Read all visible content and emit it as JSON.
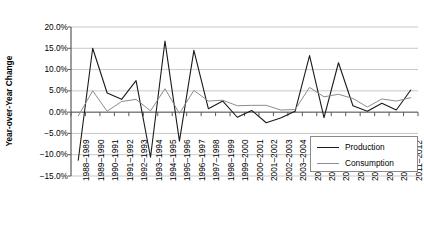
{
  "chart_data": {
    "type": "line",
    "title": "",
    "subtitle": "",
    "xlabel": "",
    "ylabel": "Year-over-Year Change",
    "ylim": [
      -15,
      20
    ],
    "ytick_values": [
      20,
      15,
      10,
      5,
      0,
      -5,
      -10,
      -15
    ],
    "ytick_labels": [
      "20.0%",
      "15.0%",
      "10.0%",
      "5.0%",
      "0.0%",
      "−5.0%",
      "−10.0%",
      "−15.0%"
    ],
    "grid": true,
    "grid_axis": "y",
    "legend_position": "bottom-right",
    "categories": [
      "1988–1989",
      "1989–1990",
      "1990–1991",
      "1991–1992",
      "1992–1993",
      "1993–1994",
      "1994–1995",
      "1995–1996",
      "1996–1997",
      "1997–1998",
      "1998–1999",
      "1999–2000",
      "2000–2001",
      "2001–2002",
      "2002–2003",
      "2003–2004",
      "2004–2005",
      "2005–2006",
      "2006–2007",
      "2007–2008",
      "2008–2009",
      "2009–2010",
      "2010–2011",
      "2011–2012"
    ],
    "series": [
      {
        "name": "Production",
        "color": "#1a1a1a",
        "width": 1.1,
        "values": [
          -11.3,
          15.0,
          4.5,
          3.0,
          7.4,
          -10.6,
          16.7,
          -6.8,
          14.5,
          0.8,
          2.6,
          -1.2,
          0.4,
          -2.5,
          -1.4,
          0.2,
          13.3,
          -1.3,
          11.6,
          1.5,
          0.2,
          2.1,
          0.5,
          5.2
        ]
      },
      {
        "name": "Consumption",
        "color": "#8c8c8c",
        "width": 1.0,
        "values": [
          -0.9,
          5.0,
          0.2,
          2.5,
          3.0,
          0.3,
          5.5,
          -0.3,
          5.1,
          2.6,
          2.8,
          1.5,
          1.6,
          1.6,
          0.5,
          0.6,
          5.8,
          3.6,
          4.2,
          3.2,
          1.2,
          3.1,
          2.6,
          3.4
        ]
      }
    ],
    "legend": [
      {
        "label": "Production",
        "color": "#1a1a1a",
        "width": 1.3
      },
      {
        "label": "Consumption",
        "color": "#8c8c8c",
        "width": 1.0
      }
    ],
    "axis": {
      "plot_left": 71,
      "plot_right": 418,
      "plot_top": 27,
      "plot_bottom": 176,
      "axis_color": "#595959",
      "grid_color": "#c8c8c8",
      "zero_line_color": "#404040"
    }
  }
}
